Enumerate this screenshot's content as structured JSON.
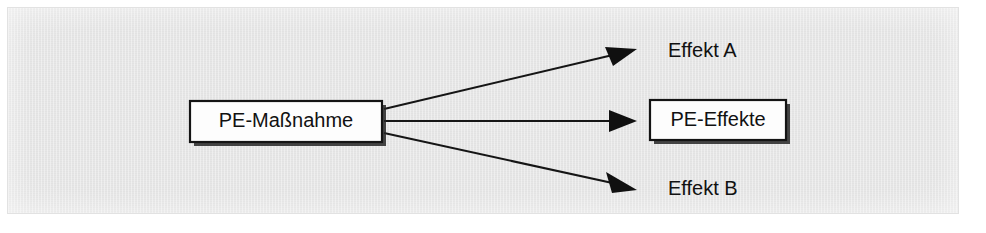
{
  "figure": {
    "type": "flow-diagram",
    "language": "de",
    "background_color": "#e9e9e9",
    "page_color": "#ffffff",
    "ink_color": "#111111",
    "nodes": {
      "source": {
        "label": "PE-Maßnahme",
        "shape": "rectangle",
        "has_border": true,
        "has_shadow": true
      },
      "target_top": {
        "label": "Effekt A",
        "shape": "plain-text",
        "has_border": false,
        "has_shadow": false
      },
      "target_middle": {
        "label": "PE-Effekte",
        "shape": "rectangle",
        "has_border": true,
        "has_shadow": true
      },
      "target_bottom": {
        "label": "Effekt B",
        "shape": "plain-text",
        "has_border": false,
        "has_shadow": false
      }
    },
    "connectors": [
      {
        "name": "arrow-to-effekt-a",
        "from": "PE-Maßnahme",
        "to": "Effekt A",
        "style": "solid-arrow",
        "direction": "up-right"
      },
      {
        "name": "arrow-to-pe-effekte",
        "from": "PE-Maßnahme",
        "to": "PE-Effekte",
        "style": "solid-arrow",
        "direction": "right"
      },
      {
        "name": "arrow-to-effekt-b",
        "from": "PE-Maßnahme",
        "to": "Effekt B",
        "style": "solid-arrow",
        "direction": "down-right"
      }
    ]
  }
}
